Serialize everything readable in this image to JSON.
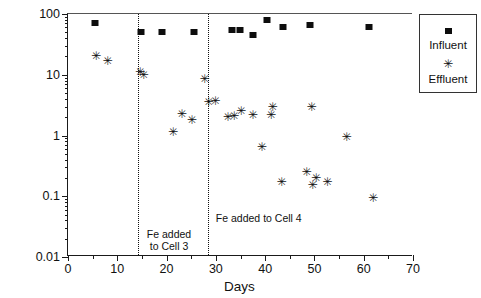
{
  "chart_data": {
    "type": "scatter",
    "title": "",
    "xlabel": "Days",
    "ylabel": "Arsenic (mg/L)",
    "xlim": [
      0,
      70
    ],
    "ylim": [
      0.01,
      100
    ],
    "yscale": "log",
    "grid": false,
    "legend_position": "right-outside",
    "x_ticks": [
      0,
      10,
      20,
      30,
      40,
      50,
      60,
      70
    ],
    "x_minor_ticks": [
      5,
      15,
      25,
      35,
      45,
      55,
      65
    ],
    "y_ticks": [
      0.01,
      0.1,
      1,
      10,
      100
    ],
    "y_tick_labels": [
      "0.01",
      "0.1",
      "1",
      "10",
      "100"
    ],
    "series": [
      {
        "name": "Influent",
        "marker": "filled-square",
        "color": "#0d0d0d",
        "points": [
          {
            "x": 5.5,
            "y": 70
          },
          {
            "x": 14.8,
            "y": 50
          },
          {
            "x": 19.0,
            "y": 50
          },
          {
            "x": 25.5,
            "y": 50
          },
          {
            "x": 33.2,
            "y": 55
          },
          {
            "x": 34.8,
            "y": 54
          },
          {
            "x": 37.5,
            "y": 45
          },
          {
            "x": 40.3,
            "y": 80
          },
          {
            "x": 43.6,
            "y": 62
          },
          {
            "x": 49.2,
            "y": 65
          },
          {
            "x": 61.0,
            "y": 62
          }
        ]
      },
      {
        "name": "Effluent",
        "marker": "asterisk",
        "color": "#111111",
        "points": [
          {
            "x": 5.6,
            "y": 20
          },
          {
            "x": 7.9,
            "y": 17
          },
          {
            "x": 14.5,
            "y": 11
          },
          {
            "x": 15.2,
            "y": 10
          },
          {
            "x": 21.2,
            "y": 1.15
          },
          {
            "x": 23.0,
            "y": 2.3
          },
          {
            "x": 25.0,
            "y": 1.8
          },
          {
            "x": 27.6,
            "y": 8.6
          },
          {
            "x": 28.4,
            "y": 3.6
          },
          {
            "x": 29.8,
            "y": 3.7
          },
          {
            "x": 32.3,
            "y": 2.05
          },
          {
            "x": 33.6,
            "y": 2.1
          },
          {
            "x": 35.0,
            "y": 2.5
          },
          {
            "x": 37.4,
            "y": 2.2
          },
          {
            "x": 39.2,
            "y": 0.65
          },
          {
            "x": 41.1,
            "y": 2.2
          },
          {
            "x": 41.4,
            "y": 3.0
          },
          {
            "x": 43.2,
            "y": 0.17
          },
          {
            "x": 48.3,
            "y": 0.25
          },
          {
            "x": 49.3,
            "y": 3.0
          },
          {
            "x": 49.5,
            "y": 0.155
          },
          {
            "x": 50.2,
            "y": 0.2
          },
          {
            "x": 52.5,
            "y": 0.17
          },
          {
            "x": 56.4,
            "y": 0.95
          },
          {
            "x": 61.8,
            "y": 0.095
          }
        ]
      }
    ],
    "annotations": [
      {
        "id": "fe-cell-3",
        "x": 14.2,
        "text": "Fe added\nto Cell 3",
        "label_x": 16.0,
        "label_y": 0.03
      },
      {
        "id": "fe-cell-4",
        "x": 28.4,
        "text": "Fe added to Cell 4",
        "label_x": 30.0,
        "label_y": 0.055
      }
    ]
  },
  "legend": {
    "entries": [
      {
        "label": "Influent",
        "symbol": "filled-square"
      },
      {
        "label": "Effluent",
        "symbol": "asterisk"
      }
    ]
  }
}
